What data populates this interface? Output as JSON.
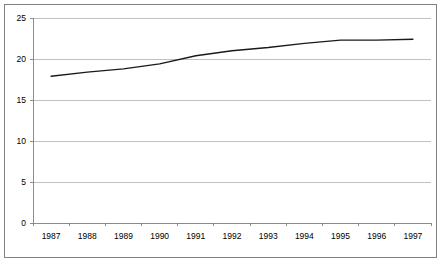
{
  "chart_data": {
    "type": "line",
    "title": "",
    "subtitle": "",
    "xlabel": "",
    "ylabel": "",
    "categories": [
      "1987",
      "1988",
      "1989",
      "1990",
      "1991",
      "1992",
      "1993",
      "1994",
      "1995",
      "1996",
      "1997"
    ],
    "values": [
      17.9,
      18.4,
      18.8,
      19.4,
      20.4,
      21.0,
      21.4,
      21.9,
      22.3,
      22.3,
      22.4
    ],
    "series": [
      {
        "name": "",
        "values": [
          17.9,
          18.4,
          18.8,
          19.4,
          20.4,
          21.0,
          21.4,
          21.9,
          22.3,
          22.3,
          22.4
        ]
      }
    ],
    "ylim": [
      0,
      25
    ],
    "y_ticks": [
      0,
      5,
      10,
      15,
      20,
      25
    ],
    "y_tick_labels": [
      "0",
      "5",
      "10",
      "15",
      "20",
      "25"
    ],
    "x_tick_labels": [
      "1987",
      "1988",
      "1989",
      "1990",
      "1991",
      "1992",
      "1993",
      "1994",
      "1995",
      "1996",
      "1997"
    ],
    "grid": true,
    "grid_axis": "y",
    "legend": false,
    "legend_position": "none",
    "annotations": [],
    "colors": {
      "line": "#1a1a1a",
      "gridline": "#b0b0b0",
      "axis": "#808080",
      "border": "#808080",
      "background": "#ffffff",
      "text": "#000000"
    }
  },
  "axis_labels": {
    "y": [
      "25",
      "20",
      "15",
      "10",
      "5",
      "0"
    ],
    "x": [
      "1987",
      "1988",
      "1989",
      "1990",
      "1991",
      "1992",
      "1993",
      "1994",
      "1995",
      "1996",
      "1997"
    ]
  }
}
